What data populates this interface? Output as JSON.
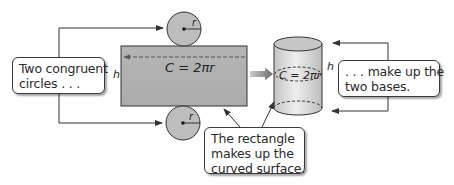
{
  "diagram": {
    "callouts": {
      "left": {
        "lines": [
          "Two congruent",
          "circles . . ."
        ]
      },
      "right": {
        "lines": [
          ". . . make up the",
          "two bases."
        ]
      },
      "bottom": {
        "lines": [
          "The rectangle",
          "makes up the",
          "curved surface."
        ]
      }
    },
    "labels": {
      "radius": "r",
      "height": "h",
      "circumference_formula": "C = 2πr"
    },
    "colors": {
      "shape_fill": "#b9b9b9",
      "rectangle_fill": "#b0b0b0",
      "stroke": "#333333",
      "arrow_fill": "#8a8a8a",
      "cylinder_fill": "#d4d4d4"
    }
  }
}
